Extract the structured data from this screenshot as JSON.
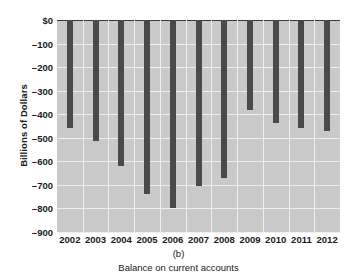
{
  "chart_data": {
    "type": "bar",
    "title": "",
    "panel_label": "(b)",
    "caption": "Balance on current accounts",
    "xlabel": "",
    "ylabel": "Billions of Dollars",
    "categories": [
      "2002",
      "2003",
      "2004",
      "2005",
      "2006",
      "2007",
      "2008",
      "2009",
      "2010",
      "2011",
      "2012"
    ],
    "values": [
      -459,
      -515,
      -621,
      -739,
      -798,
      -705,
      -672,
      -382,
      -436,
      -460,
      -471
    ],
    "ylim": [
      -900,
      0
    ],
    "ytick_values": [
      0,
      -100,
      -200,
      -300,
      -400,
      -500,
      -600,
      -700,
      -800,
      -900
    ],
    "ytick_labels": [
      "$0",
      "–100",
      "–200",
      "–300",
      "–400",
      "–500",
      "–600",
      "–700",
      "–800",
      "–900"
    ],
    "grid": true,
    "legend": null,
    "bar_color": "#4a4a4a",
    "plot_background": "#c9c9c9",
    "gridline_color": "#efefef",
    "axis_color": "#3a3a3a"
  }
}
